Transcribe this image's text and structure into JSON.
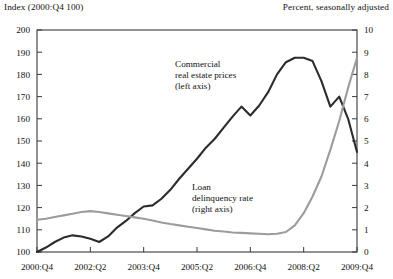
{
  "header": {
    "left_label": "Index (2000:Q4  100)",
    "right_label": "Percent, seasonally adjusted"
  },
  "annotations": {
    "series1": {
      "line1": "Commercial",
      "line2": "real estate prices",
      "line3": "(left axis)"
    },
    "series2": {
      "line1": "Loan",
      "line2": "delinquency rate",
      "line3": "(right axis)"
    }
  },
  "chart_data": {
    "type": "line",
    "title": "",
    "subtitle": "",
    "xlabel": "",
    "ylabel": "Index (2000:Q4 = 100)",
    "y2label": "Percent, seasonally adjusted",
    "grid": false,
    "legend": "annotations-inline",
    "ylim": [
      100,
      200
    ],
    "y2lim": [
      0,
      10
    ],
    "yticks": [
      100,
      110,
      120,
      130,
      140,
      150,
      160,
      170,
      180,
      190,
      200
    ],
    "y2ticks": [
      0,
      1,
      2,
      3,
      4,
      5,
      6,
      7,
      8,
      9,
      10
    ],
    "xticklabels": [
      "2000:Q4",
      "2002:Q2",
      "2003:Q4",
      "2005:Q2",
      "2006:Q4",
      "2008:Q2",
      "2009:Q4"
    ],
    "xtick_quarters": [
      "2000:Q4",
      "2002:Q2",
      "2003:Q4",
      "2005:Q2",
      "2006:Q4",
      "2008:Q2",
      "2009:Q4"
    ],
    "x": [
      "2000:Q4",
      "2001:Q1",
      "2001:Q2",
      "2001:Q3",
      "2001:Q4",
      "2002:Q1",
      "2002:Q2",
      "2002:Q3",
      "2002:Q4",
      "2003:Q1",
      "2003:Q2",
      "2003:Q3",
      "2003:Q4",
      "2004:Q1",
      "2004:Q2",
      "2004:Q3",
      "2004:Q4",
      "2005:Q1",
      "2005:Q2",
      "2005:Q3",
      "2005:Q4",
      "2006:Q1",
      "2006:Q2",
      "2006:Q3",
      "2006:Q4",
      "2007:Q1",
      "2007:Q2",
      "2007:Q3",
      "2007:Q4",
      "2008:Q1",
      "2008:Q2",
      "2008:Q3",
      "2008:Q4",
      "2009:Q1",
      "2009:Q2",
      "2009:Q3",
      "2009:Q4"
    ],
    "series": [
      {
        "name": "Commercial real estate prices (left axis)",
        "axis": "left",
        "color": "#2c2c2c",
        "units": "index, 2000:Q4 = 100",
        "values": [
          100.0,
          102.0,
          104.5,
          106.5,
          107.5,
          107.0,
          106.0,
          104.5,
          107.0,
          111.0,
          114.0,
          117.5,
          120.5,
          121.0,
          124.0,
          128.0,
          133.0,
          137.5,
          142.0,
          147.0,
          151.0,
          156.0,
          161.0,
          165.5,
          161.5,
          166.0,
          172.0,
          180.0,
          185.5,
          187.5,
          187.5,
          186.0,
          177.0,
          165.5,
          170.0,
          160.0,
          145.0
        ]
      },
      {
        "name": "Loan delinquency rate (right axis)",
        "axis": "right",
        "color": "#9c9c9c",
        "units": "percent",
        "values": [
          1.45,
          1.5,
          1.58,
          1.65,
          1.72,
          1.8,
          1.84,
          1.8,
          1.74,
          1.68,
          1.62,
          1.56,
          1.5,
          1.42,
          1.33,
          1.26,
          1.2,
          1.14,
          1.08,
          1.02,
          0.96,
          0.92,
          0.88,
          0.86,
          0.84,
          0.82,
          0.8,
          0.82,
          0.9,
          1.2,
          1.75,
          2.5,
          3.4,
          4.6,
          5.9,
          7.4,
          8.75
        ]
      }
    ],
    "series_end_notes": {
      "series1_final_index": 110,
      "series2_final_percent": 8.8
    }
  }
}
